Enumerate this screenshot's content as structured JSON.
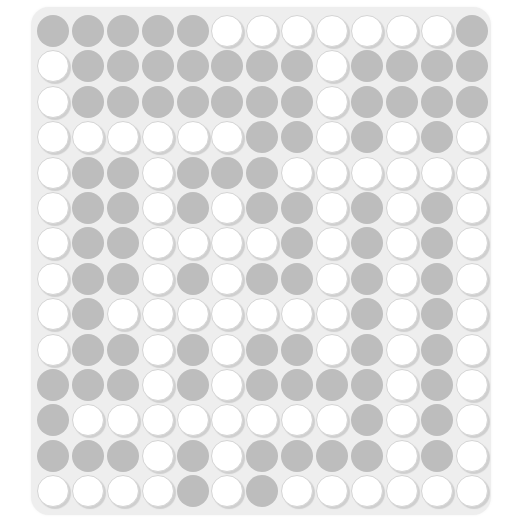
{
  "board": {
    "columns": 13,
    "rows": 14,
    "legend": {
      "G": "filled-gray",
      "W": "empty-white"
    },
    "colors": {
      "filled": "#bdbdbd",
      "empty": "#ffffff",
      "background": "#eeeeee"
    },
    "grid": [
      "GGGGGWWWWWWWG",
      "WGGGGGGGWGGGG",
      "WGGGGGGGWGGGG",
      "WWWWWWGGWGWGW",
      "WGGWGGGWWWWWW",
      "WGGWGWGGWGWGW",
      "WGGWWWWGWGWGW",
      "WGGWGWGGWGWGW",
      "WGWWWWWWWGWGW",
      "WGGWGWGGWGWGW",
      "GGGWGWGGGGWGW",
      "GWWWWWWWWGWGW",
      "GGGWGWGGGGWGW",
      "WWWWGWGWWWWWW"
    ]
  }
}
